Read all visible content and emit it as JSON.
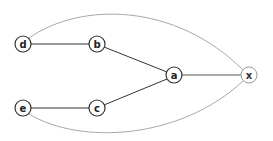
{
  "diagram": {
    "type": "undirected-graph",
    "colors": {
      "background": "#ffffff",
      "main_edge": "#333333",
      "curve_edge": "#a8a8a8",
      "node_stroke_dark": "#333333",
      "node_stroke_light": "#9a9a9a",
      "label": "#222222"
    },
    "nodes": [
      {
        "id": "d",
        "label": "d",
        "x": 23,
        "y": 44,
        "stroke": "dark"
      },
      {
        "id": "b",
        "label": "b",
        "x": 97,
        "y": 44,
        "stroke": "dark"
      },
      {
        "id": "a",
        "label": "a",
        "x": 174,
        "y": 75,
        "stroke": "dark"
      },
      {
        "id": "x",
        "label": "x",
        "x": 249,
        "y": 75,
        "stroke": "light"
      },
      {
        "id": "e",
        "label": "e",
        "x": 23,
        "y": 108,
        "stroke": "dark"
      },
      {
        "id": "c",
        "label": "c",
        "x": 97,
        "y": 108,
        "stroke": "dark"
      }
    ],
    "edges": [
      {
        "from": "d",
        "to": "b",
        "style": "straight"
      },
      {
        "from": "b",
        "to": "a",
        "style": "straight"
      },
      {
        "from": "e",
        "to": "c",
        "style": "straight"
      },
      {
        "from": "c",
        "to": "a",
        "style": "straight"
      },
      {
        "from": "a",
        "to": "x",
        "style": "straight"
      },
      {
        "from": "d",
        "to": "x",
        "style": "curve-top"
      },
      {
        "from": "e",
        "to": "x",
        "style": "curve-bottom"
      }
    ]
  }
}
